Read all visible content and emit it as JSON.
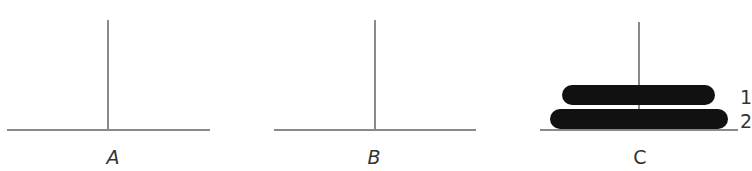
{
  "diagram": {
    "colors": {
      "peg": "#8a8a8a",
      "disk": "#111111",
      "label": "#333333"
    },
    "pegs": [
      {
        "id": "A",
        "label": "A",
        "italic": true,
        "center_x": 108,
        "base_x1": 7,
        "base_x2": 210,
        "base_y": 130,
        "pole_top": 20,
        "label_x": 113,
        "disks": []
      },
      {
        "id": "B",
        "label": "B",
        "italic": true,
        "center_x": 375,
        "base_x1": 274,
        "base_x2": 476,
        "base_y": 130,
        "pole_top": 20,
        "label_x": 374,
        "disks": []
      },
      {
        "id": "C",
        "label": "C",
        "italic": false,
        "center_x": 639,
        "base_x1": 540,
        "base_x2": 738,
        "base_y": 130,
        "pole_top": 22,
        "label_x": 640,
        "disks": [
          "1",
          "2"
        ]
      }
    ],
    "disks": [
      {
        "label": "1",
        "peg": "C",
        "x1": 562,
        "x2": 715,
        "y1": 85,
        "y2": 105,
        "label_x": 740,
        "label_y": 104
      },
      {
        "label": "2",
        "peg": "C",
        "x1": 550,
        "x2": 728,
        "y1": 109,
        "y2": 129,
        "label_x": 740,
        "label_y": 128
      }
    ]
  }
}
